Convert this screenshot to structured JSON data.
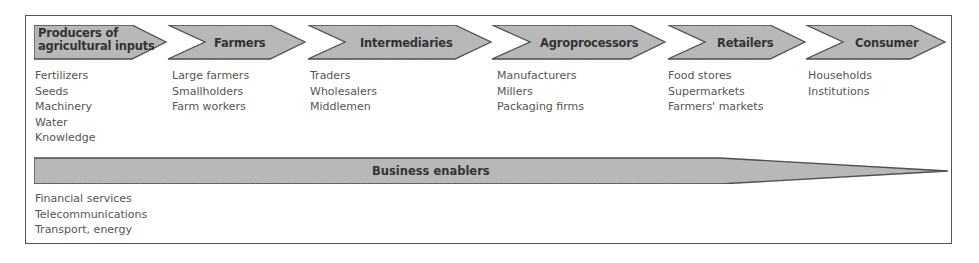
{
  "diagram": {
    "stages": [
      {
        "label": "Producers of agricultural inputs",
        "label_lines": [
          "Producers of",
          "agricultural inputs"
        ],
        "items": [
          "Fertilizers",
          "Seeds",
          "Machinery",
          "Water",
          "Knowledge"
        ]
      },
      {
        "label": "Farmers",
        "items": [
          "Large farmers",
          "Smallholders",
          "Farm workers"
        ]
      },
      {
        "label": "Intermediaries",
        "items": [
          "Traders",
          "Wholesalers",
          "Middlemen"
        ]
      },
      {
        "label": "Agroprocessors",
        "items": [
          "Manufacturers",
          "Millers",
          "Packaging firms"
        ]
      },
      {
        "label": "Retailers",
        "items": [
          "Food stores",
          "Supermarkets",
          "Farmers' markets"
        ]
      },
      {
        "label": "Consumer",
        "items": [
          "Households",
          "Institutions"
        ]
      }
    ],
    "enablers": {
      "label": "Business enablers",
      "items": [
        "Financial services",
        "Telecommunications",
        "Transport, energy"
      ]
    },
    "colors": {
      "shape_fill": "#b8b8b8",
      "shape_stroke": "#3a3a3a",
      "label_text": "#333333",
      "item_text": "#555555",
      "frame": "#555555"
    }
  }
}
